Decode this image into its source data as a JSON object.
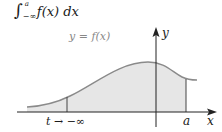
{
  "formula": {
    "integral_sign": "∫",
    "upper_limit": "a",
    "lower_limit": "−∞",
    "integrand": "f(x) dx"
  },
  "diagram": {
    "curve_label": "y = f(x)",
    "y_axis_label": "y",
    "x_axis_label": "x",
    "right_bound_label": "a",
    "left_bound_label": "t → −∞",
    "colors": {
      "fill": "#e6e6e6",
      "curve": "#8a8a8a",
      "axes": "#222222"
    }
  }
}
